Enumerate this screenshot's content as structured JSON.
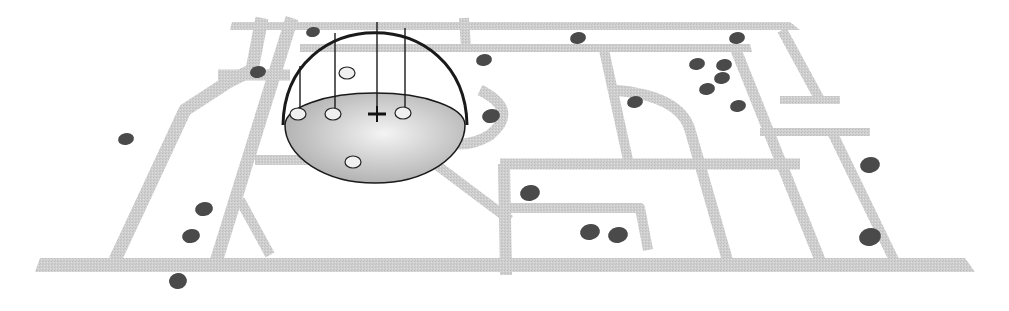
{
  "figure": {
    "colors": {
      "background": "#ffffff",
      "road": "#cfcfcf",
      "poi": "#4a4a4a",
      "dome_outline": "#1a1a1a",
      "dome_fill_light": "#f4f4f4",
      "dome_fill_dark": "#a8a8a8",
      "marker_outline": "#222222"
    },
    "roads": [
      {
        "id": "bottom-main",
        "points": "40,258 965,258 975,272 35,272",
        "type": "poly"
      },
      {
        "id": "top-main-1",
        "points": "232,22 480,22 480,30 230,30",
        "type": "poly"
      },
      {
        "id": "top-main-2",
        "points": "430,22 790,22 800,30 430,30",
        "type": "poly"
      },
      {
        "id": "top-second",
        "points": "300,44 750,44 752,52 300,52",
        "type": "poly"
      }
    ],
    "road_lines": [
      {
        "d": "M 262 18 L 252 70 L 228 82 L 185 110 L 115 260",
        "w": 13
      },
      {
        "d": "M 292 18 L 215 265",
        "w": 13
      },
      {
        "d": "M 218 75 L 290 75",
        "w": 11
      },
      {
        "d": "M 255 160 L 440 160",
        "w": 10
      },
      {
        "d": "M 240 200 L 270 255",
        "w": 10
      },
      {
        "d": "M 430 160 L 510 220",
        "w": 10
      },
      {
        "d": "M 464 18 L 466 48",
        "w": 10
      },
      {
        "d": "M 604 50 L 628 160",
        "w": 10
      },
      {
        "d": "M 612 90 Q 680 95 690 130 L 728 262",
        "w": 11
      },
      {
        "d": "M 736 50 L 820 260",
        "w": 11
      },
      {
        "d": "M 782 30 L 820 100",
        "w": 10
      },
      {
        "d": "M 780 100 L 840 100",
        "w": 8
      },
      {
        "d": "M 760 132 L 870 132",
        "w": 8
      },
      {
        "d": "M 832 132 L 895 262",
        "w": 10
      },
      {
        "d": "M 500 164 L 800 164",
        "w": 11
      },
      {
        "d": "M 504 164 L 506 275",
        "w": 12
      },
      {
        "d": "M 504 208 L 640 208 L 648 250",
        "w": 10
      },
      {
        "d": "M 480 90 Q 520 110 490 135 Q 465 150 440 140",
        "w": 11
      }
    ],
    "pois": [
      {
        "x": 313,
        "y": 32,
        "rx": 7,
        "ry": 5
      },
      {
        "x": 258,
        "y": 72,
        "rx": 8,
        "ry": 6
      },
      {
        "x": 126,
        "y": 139,
        "rx": 8,
        "ry": 6
      },
      {
        "x": 204,
        "y": 209,
        "rx": 9,
        "ry": 7
      },
      {
        "x": 191,
        "y": 236,
        "rx": 9,
        "ry": 7
      },
      {
        "x": 178,
        "y": 281,
        "rx": 9,
        "ry": 8
      },
      {
        "x": 578,
        "y": 38,
        "rx": 8,
        "ry": 6
      },
      {
        "x": 737,
        "y": 38,
        "rx": 8,
        "ry": 6
      },
      {
        "x": 484,
        "y": 60,
        "rx": 8,
        "ry": 6
      },
      {
        "x": 491,
        "y": 116,
        "rx": 9,
        "ry": 7
      },
      {
        "x": 635,
        "y": 102,
        "rx": 8,
        "ry": 6
      },
      {
        "x": 697,
        "y": 64,
        "rx": 8,
        "ry": 6
      },
      {
        "x": 724,
        "y": 65,
        "rx": 8,
        "ry": 6
      },
      {
        "x": 722,
        "y": 78,
        "rx": 8,
        "ry": 6
      },
      {
        "x": 707,
        "y": 89,
        "rx": 8,
        "ry": 6
      },
      {
        "x": 738,
        "y": 106,
        "rx": 8,
        "ry": 6
      },
      {
        "x": 530,
        "y": 193,
        "rx": 10,
        "ry": 8
      },
      {
        "x": 590,
        "y": 232,
        "rx": 10,
        "ry": 8
      },
      {
        "x": 618,
        "y": 235,
        "rx": 10,
        "ry": 8
      },
      {
        "x": 870,
        "y": 165,
        "rx": 10,
        "ry": 8
      },
      {
        "x": 870,
        "y": 237,
        "rx": 11,
        "ry": 9
      }
    ],
    "dome": {
      "cx": 375,
      "base_cy": 125,
      "rx": 90,
      "ry": 58,
      "top_y": 22,
      "markers": [
        {
          "x": 298,
          "y": 114
        },
        {
          "x": 333,
          "y": 114
        },
        {
          "x": 403,
          "y": 113
        },
        {
          "x": 347,
          "y": 73
        },
        {
          "x": 353,
          "y": 162
        }
      ],
      "stems": [
        {
          "x": 300,
          "y1": 66,
          "y2": 110
        },
        {
          "x": 335,
          "y1": 33,
          "y2": 110
        },
        {
          "x": 377,
          "y1": 22,
          "y2": 112
        },
        {
          "x": 405,
          "y1": 28,
          "y2": 108
        }
      ],
      "center": {
        "x": 377,
        "y": 114
      }
    }
  }
}
